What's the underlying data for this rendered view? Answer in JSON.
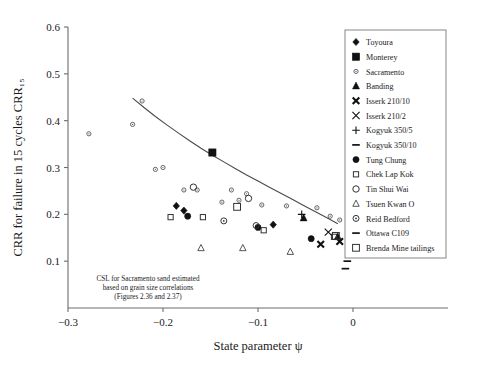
{
  "chart_data": {
    "type": "scatter",
    "title": "",
    "xlabel": "State parameter ψ",
    "ylabel": "CRR for failure in 15 cycles CRR₁₅",
    "xlim": [
      -0.3,
      0.1
    ],
    "ylim": [
      0.0,
      0.6
    ],
    "xticks": [
      -0.3,
      -0.2,
      -0.1,
      0
    ],
    "xticklabels": [
      "−0.3",
      "−0.2",
      "−0.1",
      "0"
    ],
    "yticks": [
      0.1,
      0.2,
      0.3,
      0.4,
      0.5,
      0.6
    ],
    "yticklabels": [
      "0.1",
      "0.2",
      "0.3",
      "0.4",
      "0.5",
      "0.6"
    ],
    "grid": false,
    "legend_position": "upper right",
    "annotation": {
      "line1": "CSL for Sacramento sand estimated",
      "line2": "based on grain size correlations",
      "line3": "(Figures 2.36 and 2.37)"
    },
    "curve": {
      "name": "CSL trend curve",
      "x": [
        -0.232,
        -0.22,
        -0.208,
        -0.196,
        -0.184,
        -0.172,
        -0.16,
        -0.148,
        -0.136,
        -0.124,
        -0.112,
        -0.1,
        -0.088,
        -0.076,
        -0.064,
        -0.052,
        -0.04,
        -0.028,
        -0.016
      ],
      "y": [
        0.448,
        0.428,
        0.409,
        0.391,
        0.374,
        0.357,
        0.341,
        0.326,
        0.312,
        0.298,
        0.284,
        0.271,
        0.258,
        0.245,
        0.232,
        0.219,
        0.206,
        0.193,
        0.18
      ]
    },
    "series": [
      {
        "name": "Toyoura",
        "marker": "filled-diamond",
        "points": [
          [
            -0.186,
            0.218
          ],
          [
            -0.178,
            0.208
          ],
          [
            -0.084,
            0.178
          ]
        ]
      },
      {
        "name": "Monterey",
        "marker": "filled-square",
        "points": [
          [
            -0.148,
            0.332
          ]
        ]
      },
      {
        "name": "Sacramento",
        "marker": "small-circle",
        "points": [
          [
            -0.278,
            0.372
          ],
          [
            -0.222,
            0.442
          ],
          [
            -0.232,
            0.392
          ],
          [
            -0.208,
            0.296
          ],
          [
            -0.2,
            0.3
          ],
          [
            -0.178,
            0.252
          ],
          [
            -0.164,
            0.252
          ],
          [
            -0.138,
            0.226
          ],
          [
            -0.128,
            0.252
          ],
          [
            -0.12,
            0.23
          ],
          [
            -0.112,
            0.244
          ],
          [
            -0.096,
            0.22
          ],
          [
            -0.07,
            0.218
          ],
          [
            -0.038,
            0.214
          ],
          [
            -0.024,
            0.196
          ],
          [
            -0.014,
            0.188
          ]
        ]
      },
      {
        "name": "Banding",
        "marker": "filled-triangle",
        "points": [
          [
            -0.052,
            0.192
          ],
          [
            -0.016,
            0.152
          ]
        ]
      },
      {
        "name": "Isserk 210/10",
        "marker": "x-bold",
        "points": [
          [
            -0.034,
            0.136
          ],
          [
            -0.014,
            0.142
          ]
        ]
      },
      {
        "name": "Isserk 210/2",
        "marker": "x-thin",
        "points": [
          [
            -0.026,
            0.162
          ]
        ]
      },
      {
        "name": "Kogyuk 350/5",
        "marker": "plus",
        "points": [
          [
            -0.054,
            0.2
          ]
        ]
      },
      {
        "name": "Kogyuk 350/10",
        "marker": "dash",
        "points": [
          [
            -0.006,
            0.1
          ]
        ]
      },
      {
        "name": "Tung Chung",
        "marker": "filled-circle",
        "points": [
          [
            -0.1,
            0.172
          ],
          [
            -0.174,
            0.196
          ],
          [
            -0.044,
            0.148
          ],
          [
            -0.004,
            0.15
          ]
        ]
      },
      {
        "name": "Chek Lap Kok",
        "marker": "open-square-small",
        "points": [
          [
            -0.192,
            0.194
          ],
          [
            -0.158,
            0.194
          ],
          [
            -0.094,
            0.166
          ],
          [
            -0.02,
            0.152
          ]
        ]
      },
      {
        "name": "Tin Shui Wai",
        "marker": "open-circle",
        "points": [
          [
            -0.168,
            0.258
          ],
          [
            -0.11,
            0.234
          ]
        ]
      },
      {
        "name": "Tsuen Kwan O",
        "marker": "open-triangle",
        "points": [
          [
            -0.16,
            0.128
          ],
          [
            -0.116,
            0.128
          ],
          [
            -0.066,
            0.12
          ]
        ]
      },
      {
        "name": "Reid Bedford",
        "marker": "open-circle-dot",
        "points": [
          [
            -0.136,
            0.186
          ],
          [
            -0.102,
            0.176
          ]
        ]
      },
      {
        "name": "Ottawa C109",
        "marker": "dash",
        "points": [
          [
            -0.008,
            0.084
          ]
        ]
      },
      {
        "name": "Brenda Mine tailings",
        "marker": "open-square",
        "points": [
          [
            -0.122,
            0.216
          ],
          [
            -0.018,
            0.154
          ]
        ]
      }
    ],
    "legend_entries": [
      {
        "label": "Toyoura",
        "marker": "filled-diamond"
      },
      {
        "label": "Monterey",
        "marker": "filled-square"
      },
      {
        "label": "Sacramento",
        "marker": "small-circle"
      },
      {
        "label": "Banding",
        "marker": "filled-triangle"
      },
      {
        "label": "Isserk 210/10",
        "marker": "x-bold"
      },
      {
        "label": "Isserk 210/2",
        "marker": "x-thin"
      },
      {
        "label": "Kogyuk 350/5",
        "marker": "plus"
      },
      {
        "label": "Kogyuk 350/10",
        "marker": "dash"
      },
      {
        "label": "Tung Chung",
        "marker": "filled-circle"
      },
      {
        "label": "Chek Lap Kok",
        "marker": "open-square-small"
      },
      {
        "label": "Tin Shui Wai",
        "marker": "open-circle"
      },
      {
        "label": "Tsuen Kwan O",
        "marker": "open-triangle"
      },
      {
        "label": "Reid Bedford",
        "marker": "open-circle-dot"
      },
      {
        "label": "Ottawa C109",
        "marker": "dash"
      },
      {
        "label": "Brenda Mine tailings",
        "marker": "open-square"
      }
    ]
  }
}
